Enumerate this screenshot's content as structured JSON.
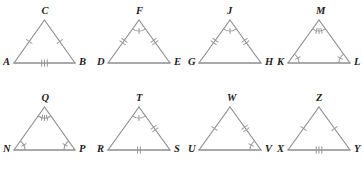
{
  "figure": {
    "line_color": "#8d8d8d",
    "mark_color": "#9a9a9a",
    "label_color": "#1c1c1c",
    "background_color": "#ffffff",
    "rows": 2,
    "columns": 4,
    "triangles": [
      {
        "id": "triangle-1",
        "row": 1,
        "column": 1,
        "apex_label": "C",
        "left_label": "A",
        "right_label": "B",
        "left_side_ticks": 1,
        "right_side_ticks": 1,
        "base_ticks": 3,
        "apex_angle_arc_ticks": 0,
        "left_angle_arc_ticks": 0,
        "right_angle_arc_ticks": 0
      },
      {
        "id": "triangle-2",
        "row": 1,
        "column": 2,
        "apex_label": "F",
        "left_label": "D",
        "right_label": "E",
        "left_side_ticks": 2,
        "right_side_ticks": 2,
        "base_ticks": 0,
        "apex_angle_arc_ticks": 1,
        "left_angle_arc_ticks": 0,
        "right_angle_arc_ticks": 0
      },
      {
        "id": "triangle-3",
        "row": 1,
        "column": 3,
        "apex_label": "J",
        "left_label": "G",
        "right_label": "H",
        "left_side_ticks": 2,
        "right_side_ticks": 2,
        "base_ticks": 0,
        "apex_angle_arc_ticks": 1,
        "left_angle_arc_ticks": 0,
        "right_angle_arc_ticks": 0
      },
      {
        "id": "triangle-4",
        "row": 1,
        "column": 4,
        "apex_label": "M",
        "left_label": "K",
        "right_label": "L",
        "left_side_ticks": 0,
        "right_side_ticks": 0,
        "base_ticks": 0,
        "apex_angle_arc_ticks": 3,
        "left_angle_arc_ticks": 1,
        "right_angle_arc_ticks": 1
      },
      {
        "id": "triangle-5",
        "row": 2,
        "column": 1,
        "apex_label": "Q",
        "left_label": "N",
        "right_label": "P",
        "left_side_ticks": 0,
        "right_side_ticks": 0,
        "base_ticks": 0,
        "apex_angle_arc_ticks": 3,
        "left_angle_arc_ticks": 1,
        "right_angle_arc_ticks": 1
      },
      {
        "id": "triangle-6",
        "row": 2,
        "column": 2,
        "apex_label": "T",
        "left_label": "R",
        "right_label": "S",
        "left_side_ticks": 0,
        "right_side_ticks": 2,
        "base_ticks": 2,
        "apex_angle_arc_ticks": 1,
        "left_angle_arc_ticks": 0,
        "right_angle_arc_ticks": 0
      },
      {
        "id": "triangle-7",
        "row": 2,
        "column": 3,
        "apex_label": "W",
        "left_label": "U",
        "right_label": "V",
        "left_side_ticks": 1,
        "right_side_ticks": 2,
        "base_ticks": 0,
        "apex_angle_arc_ticks": 0,
        "left_angle_arc_ticks": 0,
        "right_angle_arc_ticks": 1
      },
      {
        "id": "triangle-8",
        "row": 2,
        "column": 4,
        "apex_label": "Z",
        "left_label": "X",
        "right_label": "Y",
        "left_side_ticks": 1,
        "right_side_ticks": 1,
        "base_ticks": 3,
        "apex_angle_arc_ticks": 0,
        "left_angle_arc_ticks": 0,
        "right_angle_arc_ticks": 0
      }
    ]
  }
}
